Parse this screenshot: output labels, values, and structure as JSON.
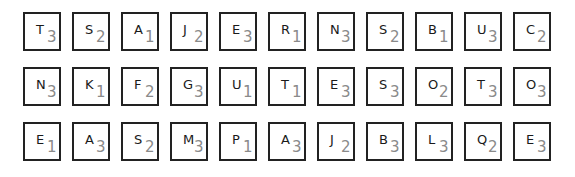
{
  "board": {
    "rows": [
      {
        "tiles": [
          {
            "letter": "T",
            "score": "3"
          },
          {
            "letter": "S",
            "score": "2"
          },
          {
            "letter": "A",
            "score": "1"
          },
          {
            "letter": "J",
            "score": "2"
          },
          {
            "letter": "E",
            "score": "3"
          },
          {
            "letter": "R",
            "score": "1"
          },
          {
            "letter": "N",
            "score": "3"
          },
          {
            "letter": "S",
            "score": "2"
          },
          {
            "letter": "B",
            "score": "1"
          },
          {
            "letter": "U",
            "score": "3"
          },
          {
            "letter": "C",
            "score": "2"
          }
        ]
      },
      {
        "tiles": [
          {
            "letter": "N",
            "score": "3"
          },
          {
            "letter": "K",
            "score": "1"
          },
          {
            "letter": "F",
            "score": "2"
          },
          {
            "letter": "G",
            "score": "3"
          },
          {
            "letter": "U",
            "score": "1"
          },
          {
            "letter": "T",
            "score": "1"
          },
          {
            "letter": "E",
            "score": "3"
          },
          {
            "letter": "S",
            "score": "3"
          },
          {
            "letter": "O",
            "score": "2"
          },
          {
            "letter": "T",
            "score": "3"
          },
          {
            "letter": "O",
            "score": "3"
          }
        ]
      },
      {
        "tiles": [
          {
            "letter": "E",
            "score": "1"
          },
          {
            "letter": "A",
            "score": "3"
          },
          {
            "letter": "S",
            "score": "2"
          },
          {
            "letter": "M",
            "score": "3"
          },
          {
            "letter": "P",
            "score": "1"
          },
          {
            "letter": "A",
            "score": "3"
          },
          {
            "letter": "J",
            "score": "2"
          },
          {
            "letter": "B",
            "score": "3"
          },
          {
            "letter": "L",
            "score": "3"
          },
          {
            "letter": "Q",
            "score": "2"
          },
          {
            "letter": "E",
            "score": "3"
          }
        ]
      }
    ]
  },
  "colors": {
    "tile_border": "#222222",
    "tile_background": "#ffffff",
    "letter": "#1a1a1a",
    "score": "#8a8a8a",
    "page_background": "#ffffff"
  }
}
